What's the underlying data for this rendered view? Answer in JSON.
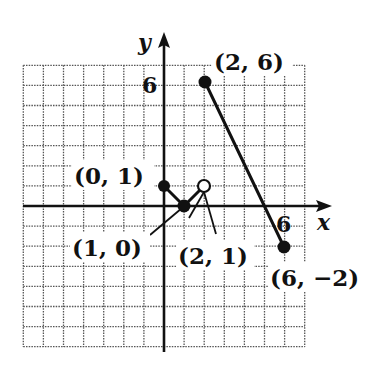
{
  "chart_data": {
    "type": "line",
    "title": "",
    "xlabel": "x",
    "ylabel": "y",
    "xlim": [
      -7,
      7
    ],
    "ylim": [
      -7,
      7
    ],
    "grid": true,
    "ticks_labeled": {
      "x": [
        "6"
      ],
      "y": [
        "6"
      ]
    },
    "series": [
      {
        "name": "segment-1",
        "points": [
          [
            0,
            1
          ],
          [
            1,
            0
          ]
        ],
        "endpoints": [
          {
            "x": 0,
            "y": 1,
            "closed": true
          },
          {
            "x": 1,
            "y": 0,
            "closed": true
          }
        ]
      },
      {
        "name": "segment-2",
        "points": [
          [
            1,
            0
          ],
          [
            2,
            1
          ]
        ],
        "endpoints": [
          {
            "x": 1,
            "y": 0,
            "closed": true
          },
          {
            "x": 2,
            "y": 1,
            "closed": false
          }
        ]
      },
      {
        "name": "segment-3",
        "points": [
          [
            2,
            6
          ],
          [
            6,
            -2
          ]
        ],
        "endpoints": [
          {
            "x": 2,
            "y": 6,
            "closed": true
          },
          {
            "x": 6,
            "y": -2,
            "closed": true
          }
        ]
      }
    ],
    "annotations": [
      {
        "text": "(0, 1)",
        "x": 0,
        "y": 1
      },
      {
        "text": "(1, 0)",
        "x": 1,
        "y": 0
      },
      {
        "text": "(2, 1)",
        "x": 2,
        "y": 1
      },
      {
        "text": "(2, 6)",
        "x": 2,
        "y": 6
      },
      {
        "text": "(6, −2)",
        "x": 6,
        "y": -2
      }
    ]
  },
  "labels": {
    "x_axis": "x",
    "y_axis": "y",
    "x_tick_6": "6",
    "y_tick_6": "6",
    "p01": "(0, 1)",
    "p10": "(1, 0)",
    "p21": "(2, 1)",
    "p26": "(2, 6)",
    "p6m2": "(6, −2)"
  },
  "colors": {
    "ink": "#111111",
    "grid": "#555555",
    "background": "#ffffff"
  }
}
